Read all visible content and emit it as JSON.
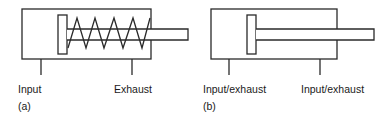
{
  "figure": {
    "panel_a": {
      "id_label": "(a)",
      "description": "Single-acting cylinder with spring return",
      "ports": [
        {
          "label": "Input"
        },
        {
          "label": "Exhaust"
        }
      ]
    },
    "panel_b": {
      "id_label": "(b)",
      "description": "Double-acting cylinder",
      "ports": [
        {
          "label": "Input/exhaust"
        },
        {
          "label": "Input/exhaust"
        }
      ]
    }
  },
  "colors": {
    "stroke": "#2a2a2a",
    "background": "#ffffff",
    "text": "#1a1a1a"
  }
}
